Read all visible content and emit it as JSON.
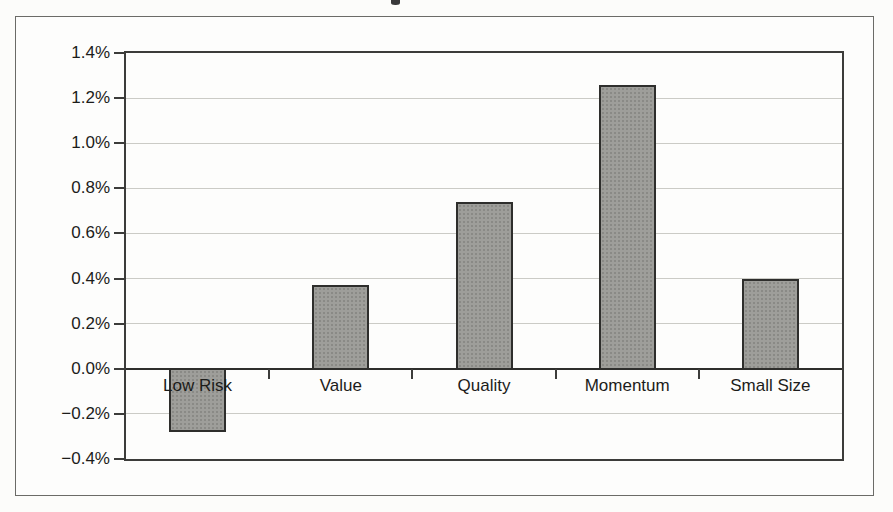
{
  "figure": {
    "background_color": "#fcfcfa",
    "frame_border_color": "#6b6b67"
  },
  "chart_data": {
    "type": "bar",
    "title": "",
    "xlabel": "",
    "ylabel": "",
    "categories": [
      "Low Risk",
      "Value",
      "Quality",
      "Momentum",
      "Small Size"
    ],
    "values": [
      -0.28,
      0.37,
      0.74,
      1.26,
      0.4
    ],
    "ylim": [
      -0.4,
      1.4
    ],
    "ytick_step": 0.2,
    "ytick_labels": [
      "1.4%",
      "1.2%",
      "1.0%",
      "0.8%",
      "0.6%",
      "0.4%",
      "0.2%",
      "0.0%",
      "−0.2%",
      "−0.4%"
    ],
    "grid": true,
    "legend": "none",
    "bar_color": "#9e9e9a",
    "bar_border_color": "#2e2e2c",
    "axis_color": "#3c3c3a",
    "gridline_color": "#cbcbc6",
    "zero_line_color": "#2e2e2c",
    "label_color": "#1c1c1a"
  }
}
